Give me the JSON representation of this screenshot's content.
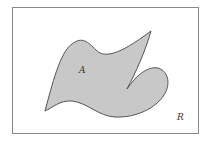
{
  "diagram": {
    "type": "set-region",
    "frame": {
      "x": 12,
      "y": 7,
      "width": 187,
      "height": 127,
      "stroke": "#777777"
    },
    "region": {
      "label": "A",
      "fill": "#c8c8c8",
      "stroke": "#555555",
      "label_pos": [
        82,
        73
      ]
    },
    "universe": {
      "label": "R",
      "label_pos": [
        178,
        120
      ]
    }
  }
}
